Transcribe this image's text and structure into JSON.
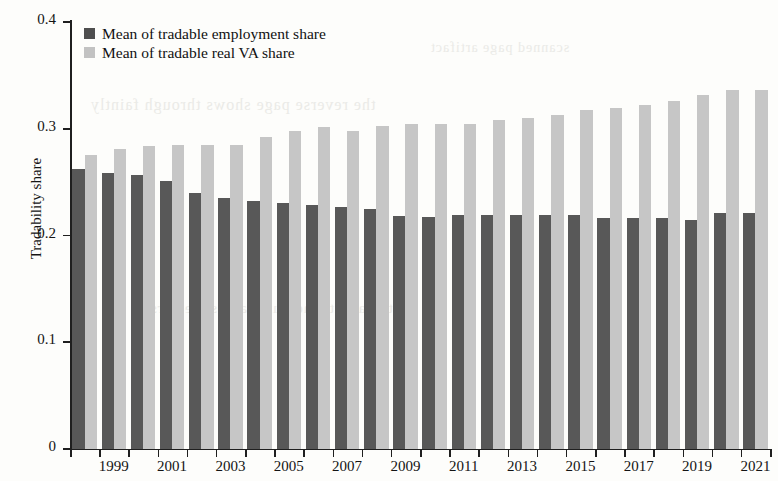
{
  "figure": {
    "background_color": "#fdfdfb",
    "axis_color": "#1f1f1f"
  },
  "axes": {
    "ylabel": "Tradability share",
    "xlabel": "",
    "y_ticks": [
      "0",
      "0.1",
      "0.2",
      "0.3",
      "0.4"
    ],
    "y_tick_values": [
      0,
      0.1,
      0.2,
      0.3,
      0.4
    ],
    "x_tick_labels": [
      "1999",
      "2001",
      "2003",
      "2005",
      "2007",
      "2009",
      "2011",
      "2013",
      "2015",
      "2017",
      "2019",
      "2021"
    ]
  },
  "legend": {
    "position": "top-left",
    "entries": [
      {
        "label": "Mean of tradable employment share",
        "color": "#4e4e4e",
        "key": "employment"
      },
      {
        "label": "Mean of tradable real VA share",
        "color": "#c2c2c2",
        "key": "value_added"
      }
    ]
  },
  "chart_data": {
    "type": "bar",
    "title": "",
    "subtitle": "",
    "xlabel": "",
    "ylabel": "Tradability share",
    "ylim": [
      0,
      0.4
    ],
    "grid": false,
    "legend_position": "top-left",
    "categories": [
      "1998",
      "1999",
      "2000",
      "2001",
      "2002",
      "2003",
      "2004",
      "2005",
      "2006",
      "2007",
      "2008",
      "2009",
      "2010",
      "2011",
      "2012",
      "2013",
      "2014",
      "2015",
      "2016",
      "2017",
      "2018",
      "2019",
      "2020",
      "2021"
    ],
    "series": [
      {
        "name": "Mean of tradable employment share",
        "color": "#585858",
        "values": [
          0.262,
          0.259,
          0.257,
          0.251,
          0.24,
          0.235,
          0.232,
          0.23,
          0.229,
          0.227,
          0.225,
          0.218,
          0.217,
          0.219,
          0.219,
          0.219,
          0.219,
          0.219,
          0.216,
          0.216,
          0.216,
          0.215,
          0.221,
          0.221
        ]
      },
      {
        "name": "Mean of tradable real VA share",
        "color": "#c6c6c6",
        "values": [
          0.275,
          0.281,
          0.284,
          0.285,
          0.285,
          0.285,
          0.292,
          0.298,
          0.302,
          0.298,
          0.303,
          0.304,
          0.304,
          0.304,
          0.308,
          0.31,
          0.313,
          0.318,
          0.319,
          0.322,
          0.326,
          0.332,
          0.336,
          0.336
        ]
      }
    ]
  },
  "bleed_text": [
    {
      "text": "the reverse page shows through faintly",
      "left": 90,
      "top": 96,
      "size": 16
    },
    {
      "text": "tradability measures across sectors",
      "left": 150,
      "top": 300,
      "size": 15
    },
    {
      "text": "scanned page artifact",
      "left": 430,
      "top": 40,
      "size": 14
    }
  ]
}
